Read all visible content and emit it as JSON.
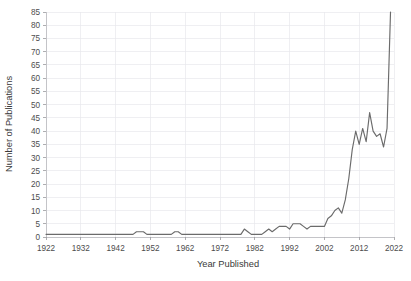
{
  "chart_data": {
    "type": "line",
    "title": "",
    "xlabel": "Year Published",
    "ylabel": "Number of Publications",
    "xlim": [
      1922,
      2022
    ],
    "ylim": [
      0,
      85
    ],
    "grid": true,
    "legend": null,
    "legend_position": "none",
    "line_color": "#6b6b6b",
    "grid_color": "#e8e8ec",
    "axis_color": "#b9b9bd",
    "text_color": "#4d4d4d",
    "x_ticks": [
      1922,
      1932,
      1942,
      1952,
      1962,
      1972,
      1982,
      1992,
      2002,
      2012,
      2022
    ],
    "x_tick_labels": [
      "1922",
      "1932",
      "1942",
      "1952",
      "1962",
      "1972",
      "1982",
      "1992",
      "2002",
      "2012",
      "2022"
    ],
    "y_ticks": [
      0,
      5,
      10,
      15,
      20,
      25,
      30,
      35,
      40,
      45,
      50,
      55,
      60,
      65,
      70,
      75,
      80,
      85
    ],
    "y_tick_labels": [
      "0",
      "5",
      "10",
      "15",
      "20",
      "25",
      "30",
      "35",
      "40",
      "45",
      "50",
      "55",
      "60",
      "65",
      "70",
      "75",
      "80",
      "85"
    ],
    "x": [
      1922,
      1923,
      1924,
      1925,
      1926,
      1927,
      1928,
      1929,
      1930,
      1931,
      1932,
      1933,
      1934,
      1935,
      1936,
      1937,
      1938,
      1939,
      1940,
      1941,
      1942,
      1943,
      1944,
      1945,
      1946,
      1947,
      1948,
      1949,
      1950,
      1951,
      1952,
      1953,
      1954,
      1955,
      1956,
      1957,
      1958,
      1959,
      1960,
      1961,
      1962,
      1963,
      1964,
      1965,
      1966,
      1967,
      1968,
      1969,
      1970,
      1971,
      1972,
      1973,
      1974,
      1975,
      1976,
      1977,
      1978,
      1979,
      1980,
      1981,
      1982,
      1983,
      1984,
      1985,
      1986,
      1987,
      1988,
      1989,
      1990,
      1991,
      1992,
      1993,
      1994,
      1995,
      1996,
      1997,
      1998,
      1999,
      2000,
      2001,
      2002,
      2003,
      2004,
      2005,
      2006,
      2007,
      2008,
      2009,
      2010,
      2011,
      2012,
      2013,
      2014,
      2015,
      2016,
      2017,
      2018,
      2019,
      2020,
      2021
    ],
    "values": [
      1,
      1,
      1,
      1,
      1,
      1,
      1,
      1,
      1,
      1,
      1,
      1,
      1,
      1,
      1,
      1,
      1,
      1,
      1,
      1,
      1,
      1,
      1,
      1,
      1,
      1,
      2,
      2,
      2,
      1,
      1,
      1,
      1,
      1,
      1,
      1,
      1,
      2,
      2,
      1,
      1,
      1,
      1,
      1,
      1,
      1,
      1,
      1,
      1,
      1,
      1,
      1,
      1,
      1,
      1,
      1,
      1,
      3,
      2,
      1,
      1,
      1,
      1,
      2,
      3,
      2,
      3,
      4,
      4,
      4,
      3,
      5,
      5,
      5,
      4,
      3,
      4,
      4,
      4,
      4,
      4,
      7,
      8,
      10,
      11,
      9,
      14,
      22,
      33,
      40,
      35,
      41,
      36,
      47,
      40,
      38,
      39,
      34,
      41,
      85
    ],
    "series": [
      {
        "name": "Number of Publications",
        "values": [
          1,
          1,
          1,
          1,
          1,
          1,
          1,
          1,
          1,
          1,
          1,
          1,
          1,
          1,
          1,
          1,
          1,
          1,
          1,
          1,
          1,
          1,
          1,
          1,
          1,
          1,
          2,
          2,
          2,
          1,
          1,
          1,
          1,
          1,
          1,
          1,
          1,
          2,
          2,
          1,
          1,
          1,
          1,
          1,
          1,
          1,
          1,
          1,
          1,
          1,
          1,
          1,
          1,
          1,
          1,
          1,
          1,
          3,
          2,
          1,
          1,
          1,
          1,
          2,
          3,
          2,
          3,
          4,
          4,
          4,
          3,
          5,
          5,
          5,
          4,
          3,
          4,
          4,
          4,
          4,
          4,
          7,
          8,
          10,
          11,
          9,
          14,
          22,
          33,
          40,
          35,
          41,
          36,
          47,
          40,
          38,
          39,
          34,
          41,
          85
        ]
      }
    ]
  }
}
